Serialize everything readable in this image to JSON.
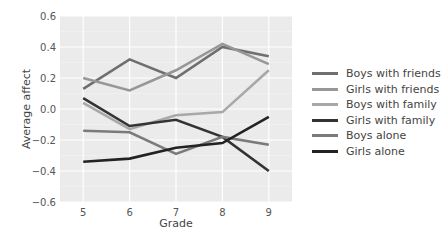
{
  "chart_data": {
    "type": "line",
    "title": "",
    "xlabel": "Grade",
    "ylabel": "Average affect",
    "x": [
      5,
      6,
      7,
      8,
      9
    ],
    "x_tick_labels": [
      "5",
      "6",
      "7",
      "8",
      "9"
    ],
    "y_tick_labels": [
      "0.6",
      "0.4",
      "0.2",
      "0.0",
      "−0.2",
      "−0.4",
      "−0.6"
    ],
    "ylim": [
      -0.6,
      0.6
    ],
    "xlim": [
      4.5,
      9.5
    ],
    "grid": true,
    "legend_position": "right",
    "series": [
      {
        "name": "Boys with friends",
        "color": "#6f6f6f",
        "values": [
          0.13,
          0.32,
          0.2,
          0.4,
          0.34
        ]
      },
      {
        "name": "Girls with friends",
        "color": "#979797",
        "values": [
          0.2,
          0.12,
          0.25,
          0.42,
          0.29
        ]
      },
      {
        "name": "Boys with family",
        "color": "#a8a8a8",
        "values": [
          0.04,
          -0.13,
          -0.04,
          -0.02,
          0.25
        ]
      },
      {
        "name": "Girls with family",
        "color": "#333333",
        "values": [
          0.07,
          -0.11,
          -0.07,
          -0.18,
          -0.4
        ]
      },
      {
        "name": "Boys alone",
        "color": "#7b7b7b",
        "values": [
          -0.14,
          -0.15,
          -0.29,
          -0.18,
          -0.23
        ]
      },
      {
        "name": "Girls alone",
        "color": "#222222",
        "values": [
          -0.34,
          -0.32,
          -0.25,
          -0.22,
          -0.05
        ]
      }
    ]
  }
}
